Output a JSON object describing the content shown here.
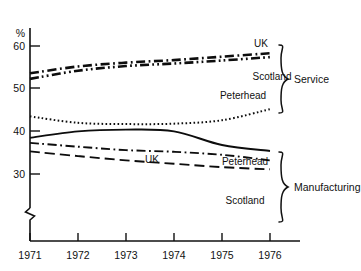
{
  "chart_data": {
    "type": "line",
    "title": "",
    "subtitle": "",
    "xlabel": "",
    "ylabel": "%",
    "ylim": [
      28,
      62
    ],
    "xlim": [
      1971,
      1976
    ],
    "grid": false,
    "legend_position": "right-inline",
    "axis_break": true,
    "y_ticks": [
      30,
      40,
      50,
      60
    ],
    "y_tick_labels": [
      "30",
      "40",
      "50",
      "60"
    ],
    "x": [
      1971,
      1972,
      1973,
      1974,
      1975,
      1976
    ],
    "x_tick_labels": [
      "1971",
      "1972",
      "1973",
      "1974",
      "1975",
      "1976"
    ],
    "groups": [
      {
        "name": "Service",
        "label": "Service",
        "series": [
          {
            "name": "UK",
            "label": "UK",
            "style": "dash-dot",
            "width": 2.6,
            "values": [
              53.6,
              55.2,
              56.1,
              56.7,
              57.5,
              58.3
            ]
          },
          {
            "name": "Scotland",
            "label": "Scotland",
            "style": "dash-dot-dot",
            "width": 2.6,
            "values": [
              52.3,
              54.2,
              55.3,
              55.9,
              56.6,
              57.4
            ]
          },
          {
            "name": "Peterhead",
            "label": "Peterhead",
            "style": "dotted",
            "width": 2.0,
            "values": [
              43.5,
              42.0,
              41.7,
              41.8,
              42.6,
              45.2
            ]
          }
        ]
      },
      {
        "name": "Manufacturing",
        "label": "Manufacturing",
        "series": [
          {
            "name": "Peterhead",
            "label": "Peterhead",
            "style": "solid",
            "width": 1.9,
            "values": [
              38.5,
              40.0,
              40.4,
              40.0,
              36.8,
              35.4
            ]
          },
          {
            "name": "UK",
            "label": "UK",
            "style": "dash-dot",
            "width": 1.9,
            "values": [
              37.3,
              36.4,
              35.6,
              35.2,
              34.5,
              33.2
            ]
          },
          {
            "name": "Scotland",
            "label": "Scotland",
            "style": "long-dash",
            "width": 1.9,
            "values": [
              35.3,
              34.2,
              33.2,
              32.4,
              31.6,
              31.1
            ]
          }
        ]
      }
    ]
  },
  "labels": {
    "y_axis_unit": "%",
    "y_tick_60": "60",
    "y_tick_50": "50",
    "y_tick_40": "40",
    "y_tick_30": "30",
    "x_tick_1971": "1971",
    "x_tick_1972": "1972",
    "x_tick_1973": "1973",
    "x_tick_1974": "1974",
    "x_tick_1975": "1975",
    "x_tick_1976": "1976",
    "service_uk": "UK",
    "service_scotland": "Scotland",
    "service_peterhead": "Peterhead",
    "service_group": "Service",
    "manufacturing_peterhead": "Peterhead",
    "manufacturing_uk": "UK",
    "manufacturing_scotland": "Scotland",
    "manufacturing_group": "Manufacturing"
  },
  "colors": {
    "ink": "#111111",
    "background": "#ffffff"
  }
}
